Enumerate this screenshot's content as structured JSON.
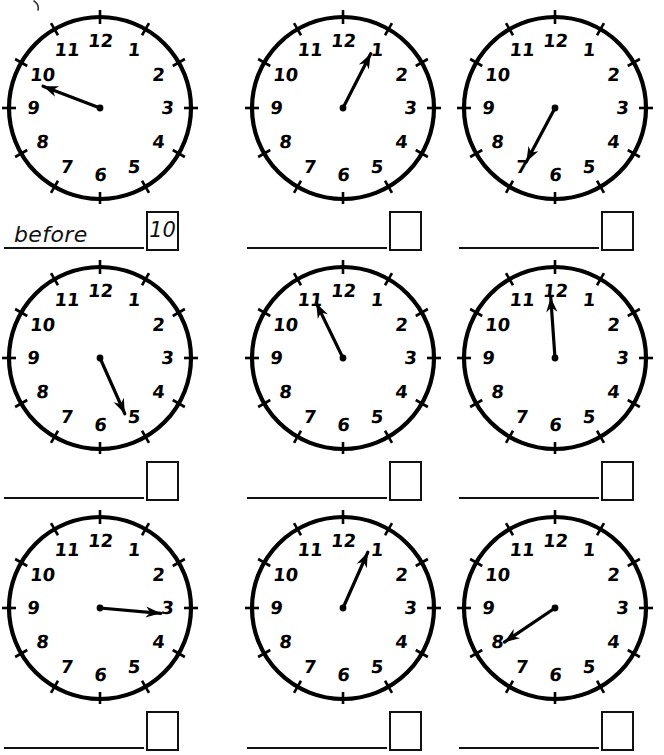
{
  "worksheet": {
    "title": "Clock reading worksheet",
    "stray_mark": "partial-ink-mark",
    "columns": 3,
    "rows": 3,
    "clock": {
      "numerals": [
        "12",
        "1",
        "2",
        "3",
        "4",
        "5",
        "6",
        "7",
        "8",
        "9",
        "10",
        "11"
      ],
      "tick_count": 12,
      "outline_color": "#000000",
      "hand_color": "#000000",
      "face_color": "#ffffff"
    },
    "items": [
      {
        "index": 1,
        "clock_name": "clock-face-1",
        "hand_angle_deg": 291,
        "hand_points_to": "just before 10",
        "answer_word": "before",
        "answer_word_filled": true,
        "answer_box_value": "10",
        "answer_box_filled": true
      },
      {
        "index": 2,
        "clock_name": "clock-face-2",
        "hand_angle_deg": 27,
        "hand_points_to": "just before 1",
        "answer_word": "",
        "answer_word_filled": false,
        "answer_box_value": "",
        "answer_box_filled": false
      },
      {
        "index": 3,
        "clock_name": "clock-face-3",
        "hand_angle_deg": 208,
        "hand_points_to": "just after 7",
        "answer_word": "",
        "answer_word_filled": false,
        "answer_box_value": "",
        "answer_box_filled": false
      },
      {
        "index": 4,
        "clock_name": "clock-face-4",
        "hand_angle_deg": 156,
        "hand_points_to": "just before 5",
        "answer_word": "",
        "answer_word_filled": false,
        "answer_box_value": "",
        "answer_box_filled": false
      },
      {
        "index": 5,
        "clock_name": "clock-face-5",
        "hand_angle_deg": 334,
        "hand_points_to": "just after 11",
        "answer_word": "",
        "answer_word_filled": false,
        "answer_box_value": "",
        "answer_box_filled": false
      },
      {
        "index": 6,
        "clock_name": "clock-face-6",
        "hand_angle_deg": 356,
        "hand_points_to": "just before 12",
        "answer_word": "",
        "answer_word_filled": false,
        "answer_box_value": "",
        "answer_box_filled": false
      },
      {
        "index": 7,
        "clock_name": "clock-face-7",
        "hand_angle_deg": 95,
        "hand_points_to": "just after 3",
        "answer_word": "",
        "answer_word_filled": false,
        "answer_box_value": "",
        "answer_box_filled": false
      },
      {
        "index": 8,
        "clock_name": "clock-face-8",
        "hand_angle_deg": 24,
        "hand_points_to": "just before 1",
        "answer_word": "",
        "answer_word_filled": false,
        "answer_box_value": "",
        "answer_box_filled": false
      },
      {
        "index": 9,
        "clock_name": "clock-face-9",
        "hand_angle_deg": 236,
        "hand_points_to": "just after 8",
        "answer_word": "",
        "answer_word_filled": false,
        "answer_box_value": "",
        "answer_box_filled": false
      }
    ]
  }
}
